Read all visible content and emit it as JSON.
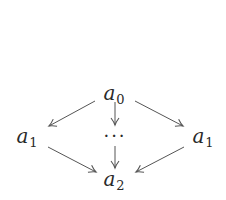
{
  "diagram": {
    "type": "commutative-diagram",
    "nodes": {
      "top": {
        "base": "a",
        "sub": "0",
        "x": 114,
        "y": 94
      },
      "left": {
        "base": "a",
        "sub": "1",
        "x": 27,
        "y": 137
      },
      "center": {
        "label": "···",
        "x": 115,
        "y": 138
      },
      "right": {
        "base": "a",
        "sub": "1",
        "x": 203,
        "y": 137
      },
      "bottom": {
        "base": "a",
        "sub": "2",
        "x": 114,
        "y": 180
      }
    },
    "edges": [
      {
        "from": "top",
        "to": "left"
      },
      {
        "from": "top",
        "to": "center"
      },
      {
        "from": "top",
        "to": "right"
      },
      {
        "from": "left",
        "to": "bottom"
      },
      {
        "from": "center",
        "to": "bottom"
      },
      {
        "from": "right",
        "to": "bottom"
      }
    ],
    "colors": {
      "stroke": "#555555",
      "text": "#2a2a2a",
      "background": "#ffffff"
    }
  }
}
